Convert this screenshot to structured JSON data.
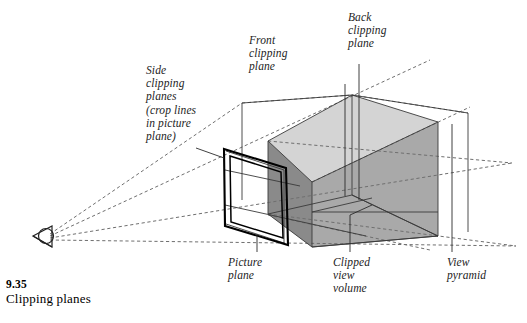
{
  "figure": {
    "caption_number": "9.35",
    "caption_text": "Clipping planes",
    "background_color": "#ffffff",
    "ink_color": "#1a1a1a"
  },
  "labels": {
    "side_clipping": "Side\nclipping\nplanes\n(crop lines\nin picture\nplane)",
    "front_clipping": "Front\nclipping\nplane",
    "back_clipping": "Back\nclipping\nplane",
    "picture_plane": "Picture\nplane",
    "clipped_view_volume": "Clipped\nview\nvolume",
    "view_pyramid": "View\npyramid"
  },
  "diagram": {
    "viewpoint_icon": "eye-viewpoint-icon",
    "picture_plane_stroke": "#000000",
    "front_clipping_plane_fill": "#8c8c8c",
    "back_clipping_plane_fill": "#a9a9a9",
    "volume_top_fill": "#d2d2d2",
    "volume_bottom_fill": "#bdbdbd",
    "ray_style": "dashed",
    "ray_color": "#6e6e6e"
  }
}
